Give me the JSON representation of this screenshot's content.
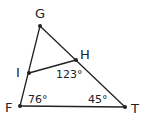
{
  "diagram": {
    "type": "geometry-triangle",
    "colors": {
      "stroke": "#222222",
      "text": "#222222",
      "background": "#ffffff"
    },
    "points": {
      "G": {
        "label": "G",
        "x": 40,
        "y": 26
      },
      "H": {
        "label": "H",
        "x": 76,
        "y": 60
      },
      "I": {
        "label": "I",
        "x": 29,
        "y": 73
      },
      "F": {
        "label": "F",
        "x": 20,
        "y": 106
      },
      "T": {
        "label": "T",
        "x": 125,
        "y": 107
      }
    },
    "segments": [
      [
        "G",
        "F"
      ],
      [
        "G",
        "T"
      ],
      [
        "F",
        "T"
      ],
      [
        "I",
        "H"
      ]
    ],
    "angles": {
      "IHT": {
        "label": "123°"
      },
      "F": {
        "label": "76°"
      },
      "T": {
        "label": "45°"
      }
    }
  }
}
